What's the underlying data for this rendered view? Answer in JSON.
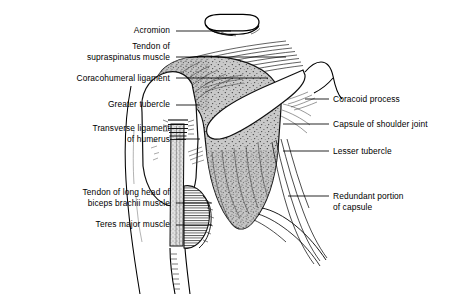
{
  "figure": {
    "type": "anatomical-line-illustration",
    "background_color": "#ffffff",
    "ink_color": "#000000",
    "capsule_fill_color": "#c8c8c8"
  },
  "labels_left": [
    {
      "id": "acromion",
      "text": "Acromion",
      "x": 77,
      "y": 25,
      "width": 93,
      "line_x1": 176,
      "line_x2": 231,
      "line_y": 31
    },
    {
      "id": "supraspinatus-tendon",
      "text": "Tendon of\nsupraspinatus muscle",
      "x": 14,
      "y": 41,
      "width": 156,
      "line_x1": 176,
      "line_x2": 286,
      "line_y": 57
    },
    {
      "id": "coracohumeral-ligament",
      "text": "Coracohumeral ligament",
      "x": 14,
      "y": 73,
      "width": 156,
      "line_x1": 176,
      "line_x2": 268,
      "line_y": 78
    },
    {
      "id": "greater-tubercle",
      "text": "Greater tubercle",
      "x": 50,
      "y": 99,
      "width": 120,
      "line_x1": 176,
      "line_x2": 200,
      "line_y": 105
    },
    {
      "id": "transverse-ligament-humerus",
      "text": "Transverse ligament\nof humerus",
      "x": 24,
      "y": 123,
      "width": 146,
      "line_x1": 176,
      "line_x2": 200,
      "line_y": 139
    },
    {
      "id": "biceps-brachii-long-head-tendon",
      "text": "Tendon of long head of\nbiceps brachii muscle",
      "x": 14,
      "y": 187,
      "width": 156,
      "line_x1": 176,
      "line_x2": 212,
      "line_y": 203
    },
    {
      "id": "teres-major-muscle",
      "text": "Teres major muscle",
      "x": 38,
      "y": 219,
      "width": 132,
      "line_x1": 176,
      "line_x2": 212,
      "line_y": 225
    }
  ],
  "labels_right": [
    {
      "id": "coracoid-process",
      "text": "Coracoid process",
      "x": 333,
      "y": 94,
      "line_x1": 305,
      "line_x2": 329,
      "line_y": 99
    },
    {
      "id": "capsule-of-shoulder-joint",
      "text": "Capsule of shoulder joint",
      "x": 333,
      "y": 119,
      "line_x1": 283,
      "line_x2": 329,
      "line_y": 124
    },
    {
      "id": "lesser-tubercle",
      "text": "Lesser tubercle",
      "x": 333,
      "y": 146,
      "line_x1": 283,
      "line_x2": 329,
      "line_y": 151
    },
    {
      "id": "redundant-portion-capsule",
      "text": "Redundant portion\nof capsule",
      "x": 333,
      "y": 191,
      "line_x1": 288,
      "line_x2": 329,
      "line_y": 196
    }
  ]
}
